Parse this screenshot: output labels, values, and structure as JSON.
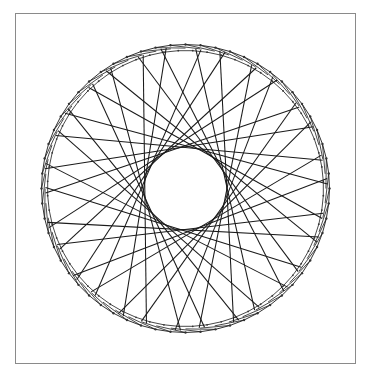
{
  "figure": {
    "type": "string-art star polygon",
    "frame": {
      "x": 15,
      "y": 13,
      "width": 341,
      "height": 351,
      "border_color": "#8a8a8a"
    },
    "circle": {
      "cx": 185.5,
      "cy": 188.5,
      "outer_radius": 144,
      "inner_hole_radius": 38
    },
    "star": {
      "vertices": 15,
      "angle_step_deg": 24,
      "skip": 6,
      "start_angle_deg": -100,
      "drift_deg": 2.2,
      "passes": 2
    },
    "ring": {
      "dot_count": 60,
      "band_width": 6,
      "dot_radius": 0.9
    },
    "colors": {
      "line": "#1a1a1a",
      "dots": "#333333",
      "background": "#ffffff"
    }
  }
}
